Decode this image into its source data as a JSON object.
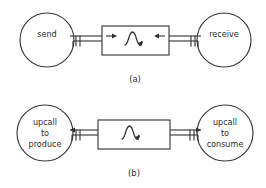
{
  "figure": {
    "background_color": "#fefefe",
    "line_color": "#3a3a3a",
    "text_color": "#2b2b2b"
  },
  "panels": [
    {
      "id": "panel-a",
      "caption": "(a)",
      "left_node": {
        "name": "send-node",
        "lines": [
          "send"
        ]
      },
      "right_node": {
        "name": "receive-node",
        "lines": [
          "receive"
        ]
      },
      "channel": {
        "name": "channel-box",
        "symbol": "sine-wave",
        "left_arrow_direction": "right",
        "right_arrow_direction": "left",
        "connector_symbol": "double-tick"
      }
    },
    {
      "id": "panel-b",
      "caption": "(b)",
      "left_node": {
        "name": "upcall-produce-node",
        "lines": [
          "upcall",
          "to",
          "produce"
        ]
      },
      "right_node": {
        "name": "upcall-consume-node",
        "lines": [
          "upcall",
          "to",
          "consume"
        ]
      },
      "channel": {
        "name": "channel-box",
        "symbol": "sine-wave",
        "left_arrow_direction": "left",
        "right_arrow_direction": "right",
        "connector_symbol": "double-tick"
      }
    }
  ]
}
